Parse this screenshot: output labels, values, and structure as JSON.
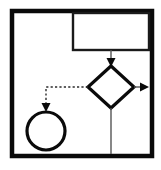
{
  "canvas": {
    "width": 161,
    "height": 170,
    "background_color": "#ffffff",
    "title": "Flowchart Diagram"
  },
  "palette": {
    "stroke_dark": "#000000",
    "stroke_thin": "#3b3b3b",
    "fill_none": "none"
  },
  "shapes": {
    "outer_frame": {
      "name": "outer-frame",
      "type": "rectangle",
      "x": 12,
      "y": 11,
      "width": 140,
      "height": 145,
      "stroke": "#0a0a0a",
      "stroke_width": 4.5,
      "fill": "none"
    },
    "top_right_box": {
      "name": "process-box",
      "type": "rectangle",
      "x": 73,
      "y": 13,
      "width": 76,
      "height": 37,
      "stroke": "#1a1a1a",
      "stroke_width": 2.4,
      "fill": "none"
    },
    "decision_diamond": {
      "name": "decision-diamond",
      "type": "diamond",
      "center_x": 111,
      "center_y": 87,
      "half_width": 23,
      "half_height": 21,
      "stroke": "#0a0a0a",
      "stroke_width": 3.2,
      "fill": "none"
    },
    "terminator_circle": {
      "name": "terminator-circle",
      "type": "circle",
      "center_x": 46,
      "center_y": 131,
      "radius": 19,
      "stroke": "#0a0a0a",
      "stroke_width": 3.2,
      "fill": "none"
    }
  },
  "connectors": {
    "box_to_diamond": {
      "name": "connector-box-to-diamond",
      "style": "solid",
      "stroke": "#555555",
      "stroke_width": 1.4,
      "path": "M 111 50 L 111 62",
      "arrow_head": {
        "at_x": 111,
        "at_y": 66,
        "direction": "down",
        "size": 5.5,
        "color": "#0a0a0a"
      }
    },
    "diamond_to_right": {
      "name": "connector-diamond-to-right",
      "style": "solid",
      "stroke": "#555555",
      "stroke_width": 1.4,
      "path": "M 134 87 L 143 87",
      "arrow_head": {
        "at_x": 149,
        "at_y": 87,
        "direction": "right",
        "size": 5.5,
        "color": "#0a0a0a"
      }
    },
    "diamond_to_bottom": {
      "name": "connector-diamond-to-bottom",
      "style": "solid",
      "stroke": "#555555",
      "stroke_width": 1.4,
      "path": "M 111 108 L 111 154",
      "arrow_head": null
    },
    "diamond_to_circle": {
      "name": "connector-diamond-to-circle",
      "style": "dashed",
      "stroke": "#2b2b2b",
      "stroke_width": 1.4,
      "dash_pattern": "2.2 2.2",
      "path": "M 88 87 L 46 87 L 46 106",
      "arrow_head": {
        "at_x": 46,
        "at_y": 112,
        "direction": "down",
        "size": 5.5,
        "color": "#0a0a0a"
      }
    }
  },
  "labels": {
    "outer_frame": "",
    "process_box": "",
    "decision_diamond": "",
    "terminator_circle": ""
  }
}
